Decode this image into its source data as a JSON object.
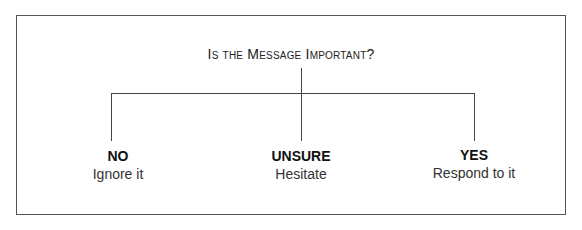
{
  "diagram": {
    "question": "Is the Message Important?",
    "branches": [
      {
        "label": "NO",
        "action": "Ignore it"
      },
      {
        "label": "UNSURE",
        "action": "Hesitate"
      },
      {
        "label": "YES",
        "action": "Respond to it"
      }
    ]
  }
}
